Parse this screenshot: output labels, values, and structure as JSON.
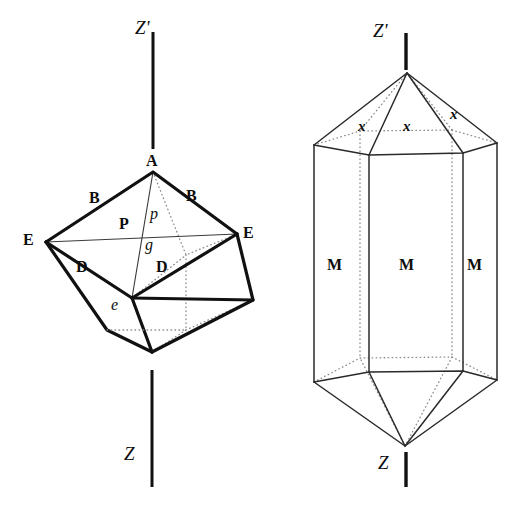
{
  "figure": {
    "background_color": "#ffffff",
    "ink_color": "#111111",
    "hidden_edge_color": "#8a8a8a"
  },
  "left_crystal": {
    "name": "rhombohedral-crystal",
    "axis_top_label": "Z'",
    "axis_bottom_label": "Z",
    "face_labels": {
      "apex": "A",
      "upper_left_face": "B",
      "upper_right_face": "B",
      "left_vertex": "E",
      "right_vertex": "E",
      "lower_left_face": "D",
      "lower_right_face": "D",
      "front_face": "P",
      "plane_p": "p",
      "plane_g": "g",
      "edge_e": "e"
    }
  },
  "right_crystal": {
    "name": "hexagonal-prism-crystal",
    "axis_top_label": "Z'",
    "axis_bottom_label": "Z",
    "pyramid_face_labels": [
      "x",
      "x",
      "x"
    ],
    "prism_face_labels": [
      "M",
      "M",
      "M"
    ]
  }
}
